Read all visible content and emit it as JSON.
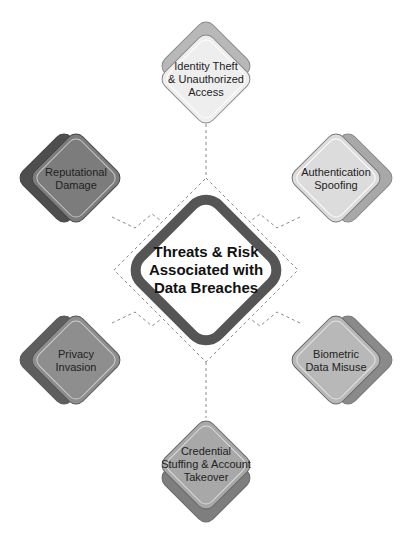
{
  "diagram": {
    "center": {
      "title_lines": [
        "Threats & Risk",
        "Associated with",
        "Data Breaches"
      ]
    },
    "nodes": [
      {
        "id": "top",
        "lines": [
          "Identity Theft",
          "& Unauthorized",
          "Access"
        ],
        "fill": "#eeeeee",
        "shadow": "#b8b8b8"
      },
      {
        "id": "top-right",
        "lines": [
          "Authentication",
          "Spoofing"
        ],
        "fill": "#dcdcdc",
        "shadow": "#a8a8a8"
      },
      {
        "id": "bottom-right",
        "lines": [
          "Biometric",
          "Data Misuse"
        ],
        "fill": "#b8b8b8",
        "shadow": "#8a8a8a"
      },
      {
        "id": "bottom",
        "lines": [
          "Credential",
          "Stuffing & Account",
          "Takeover"
        ],
        "fill": "#a8a8a8",
        "shadow": "#7e7e7e"
      },
      {
        "id": "bottom-left",
        "lines": [
          "Privacy",
          "Invasion"
        ],
        "fill": "#8e8e8e",
        "shadow": "#5e5e5e"
      },
      {
        "id": "top-left",
        "lines": [
          "Reputational",
          "Damage"
        ],
        "fill": "#7c7c7c",
        "shadow": "#4e4e4e"
      }
    ],
    "colors": {
      "center_border": "#555555",
      "center_fill": "#ffffff",
      "connector": "#888888"
    }
  }
}
